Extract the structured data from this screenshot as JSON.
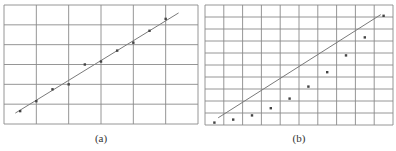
{
  "figure": {
    "captions": [
      "(a)",
      "(b)"
    ]
  },
  "chart_data": [
    {
      "type": "scatter",
      "panel": "(a)",
      "title": "",
      "xlabel": "",
      "ylabel": "",
      "grid": true,
      "grid_columns": 6,
      "grid_rows": 6,
      "xlim": [
        0,
        6
      ],
      "ylim": [
        0,
        6
      ],
      "series": [
        {
          "name": "data points",
          "x": [
            0.5,
            1.0,
            1.5,
            2.0,
            2.5,
            3.0,
            3.5,
            4.0,
            4.5,
            5.0
          ],
          "y": [
            0.65,
            1.15,
            1.75,
            2.0,
            3.0,
            3.15,
            3.7,
            4.1,
            4.7,
            5.3
          ]
        },
        {
          "name": "fit line",
          "type": "line",
          "x": [
            0.35,
            5.4
          ],
          "y": [
            0.55,
            5.6
          ]
        }
      ],
      "frame": {
        "left": 4,
        "top": 5,
        "right": 198,
        "bottom": 124
      }
    },
    {
      "type": "scatter",
      "panel": "(b)",
      "title": "",
      "xlabel": "",
      "ylabel": "",
      "grid": true,
      "grid_columns": 10,
      "grid_rows": 10,
      "xlim": [
        0,
        10
      ],
      "ylim": [
        0,
        10
      ],
      "series": [
        {
          "name": "data points",
          "x": [
            0.5,
            1.5,
            2.5,
            3.5,
            4.5,
            5.5,
            6.5,
            7.5,
            8.5,
            9.5
          ],
          "y": [
            0.2,
            0.45,
            0.8,
            1.4,
            2.2,
            3.2,
            4.4,
            5.8,
            7.3,
            9.1
          ]
        },
        {
          "name": "fit line",
          "type": "line",
          "x": [
            0.7,
            9.35
          ],
          "y": [
            0.6,
            9.2
          ]
        }
      ],
      "frame": {
        "left": 205,
        "top": 5,
        "right": 393,
        "bottom": 125
      }
    }
  ],
  "style": {
    "grid_color": "#8a8a8a",
    "line_color": "#7a7a7a",
    "point_color": "#444444"
  }
}
